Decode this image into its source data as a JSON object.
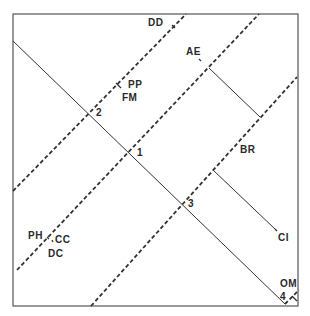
{
  "header": {
    "text": ""
  },
  "colors": {
    "line": "#333333",
    "frame": "#555555",
    "background": "#ffffff"
  },
  "frame": {
    "x1": 13,
    "y1": 14,
    "x2": 298,
    "y2": 306
  },
  "solid_lines": [
    {
      "id": "main-diagonal",
      "x1": 13,
      "y1": 41,
      "x2": 285,
      "y2": 304
    },
    {
      "id": "ae-segment",
      "x1": 209,
      "y1": 68,
      "x2": 260,
      "y2": 117
    },
    {
      "id": "br-ci-segment",
      "x1": 213,
      "y1": 170,
      "x2": 275,
      "y2": 229
    }
  ],
  "dashed_lines": [
    {
      "id": "dd-line",
      "x1": 13,
      "y1": 191,
      "x2": 186,
      "y2": 14
    },
    {
      "id": "ph-line",
      "x1": 17,
      "y1": 270,
      "x2": 259,
      "y2": 14
    },
    {
      "id": "br-line",
      "x1": 91,
      "y1": 306,
      "x2": 297,
      "y2": 77
    },
    {
      "id": "om-line",
      "x1": 285,
      "y1": 304,
      "x2": 299,
      "y2": 290
    }
  ],
  "ticks": [
    {
      "id": "dd-tick",
      "x1": 172,
      "y1": 25,
      "x2": 175,
      "y2": 28
    },
    {
      "id": "pp-tick",
      "x1": 116,
      "y1": 83,
      "x2": 121,
      "y2": 88
    },
    {
      "id": "ae-tick",
      "x1": 199,
      "y1": 59,
      "x2": 201,
      "y2": 61
    },
    {
      "id": "ph-tick",
      "x1": 47,
      "y1": 237,
      "x2": 49,
      "y2": 239
    },
    {
      "id": "cc-tick",
      "x1": 52,
      "y1": 240,
      "x2": 53,
      "y2": 242
    },
    {
      "id": "ci-tick",
      "x1": 275,
      "y1": 229,
      "x2": 277,
      "y2": 231
    },
    {
      "id": "om-tick",
      "x1": 292,
      "y1": 296,
      "x2": 297,
      "y2": 301
    }
  ],
  "labels": {
    "dd": {
      "text": "DD",
      "x": 148,
      "y": 18
    },
    "ae": {
      "text": "AE",
      "x": 186,
      "y": 47
    },
    "pp": {
      "text": "PP",
      "x": 128,
      "y": 80
    },
    "fm": {
      "text": "FM",
      "x": 122,
      "y": 93
    },
    "p2": {
      "text": "2",
      "x": 96,
      "y": 108
    },
    "p1": {
      "text": "1",
      "x": 137,
      "y": 148
    },
    "br": {
      "text": "BR",
      "x": 240,
      "y": 145
    },
    "p3": {
      "text": "3",
      "x": 188,
      "y": 199
    },
    "ph": {
      "text": "PH",
      "x": 28,
      "y": 231
    },
    "cc": {
      "text": "CC",
      "x": 55,
      "y": 235
    },
    "dc": {
      "text": "DC",
      "x": 48,
      "y": 249
    },
    "ci": {
      "text": "CI",
      "x": 278,
      "y": 233
    },
    "om": {
      "text": "OM",
      "x": 280,
      "y": 279
    },
    "p4": {
      "text": "4",
      "x": 280,
      "y": 292
    }
  }
}
